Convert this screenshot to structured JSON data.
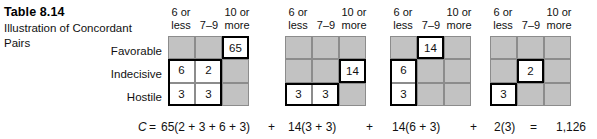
{
  "caption": {
    "table_number": "Table 8.14",
    "title": "Illustration of Concordant Pairs"
  },
  "row_labels": [
    "Favorable",
    "Indecisive",
    "Hostile"
  ],
  "column_headers": [
    {
      "line1": "6 or",
      "line2": "less"
    },
    {
      "line1": "",
      "line2": "7–9"
    },
    {
      "line1": "10 or",
      "line2": "more"
    }
  ],
  "grids": [
    {
      "name": "grid-1",
      "cells": [
        [
          {
            "value": "",
            "highlight": false,
            "boxed": false
          },
          {
            "value": "",
            "highlight": false,
            "boxed": false
          },
          {
            "value": "65",
            "highlight": true,
            "boxed": true
          }
        ],
        [
          {
            "value": "6",
            "highlight": true,
            "boxed": false
          },
          {
            "value": "2",
            "highlight": true,
            "boxed": false
          },
          {
            "value": "",
            "highlight": false,
            "boxed": false
          }
        ],
        [
          {
            "value": "3",
            "highlight": true,
            "boxed": false
          },
          {
            "value": "3",
            "highlight": true,
            "boxed": false
          },
          {
            "value": "",
            "highlight": false,
            "boxed": false
          }
        ]
      ],
      "outline": {
        "left": 0,
        "top": 23.33,
        "width": 54,
        "height": 46.66
      }
    },
    {
      "name": "grid-2",
      "cells": [
        [
          {
            "value": "",
            "highlight": false,
            "boxed": false
          },
          {
            "value": "",
            "highlight": false,
            "boxed": false
          },
          {
            "value": "",
            "highlight": false,
            "boxed": false
          }
        ],
        [
          {
            "value": "",
            "highlight": false,
            "boxed": false
          },
          {
            "value": "",
            "highlight": false,
            "boxed": false
          },
          {
            "value": "14",
            "highlight": true,
            "boxed": true
          }
        ],
        [
          {
            "value": "3",
            "highlight": true,
            "boxed": false
          },
          {
            "value": "3",
            "highlight": true,
            "boxed": false
          },
          {
            "value": "",
            "highlight": false,
            "boxed": false
          }
        ]
      ],
      "outline": {
        "left": 0,
        "top": 46.66,
        "width": 54,
        "height": 23.33
      }
    },
    {
      "name": "grid-3",
      "cells": [
        [
          {
            "value": "",
            "highlight": false,
            "boxed": false
          },
          {
            "value": "14",
            "highlight": true,
            "boxed": true
          },
          {
            "value": "",
            "highlight": false,
            "boxed": false
          }
        ],
        [
          {
            "value": "6",
            "highlight": true,
            "boxed": false
          },
          {
            "value": "",
            "highlight": false,
            "boxed": false
          },
          {
            "value": "",
            "highlight": false,
            "boxed": false
          }
        ],
        [
          {
            "value": "3",
            "highlight": true,
            "boxed": false
          },
          {
            "value": "",
            "highlight": false,
            "boxed": false
          },
          {
            "value": "",
            "highlight": false,
            "boxed": false
          }
        ]
      ],
      "outline": {
        "left": 0,
        "top": 23.33,
        "width": 27,
        "height": 46.66
      }
    },
    {
      "name": "grid-4",
      "cells": [
        [
          {
            "value": "",
            "highlight": false,
            "boxed": false
          },
          {
            "value": "",
            "highlight": false,
            "boxed": false
          },
          {
            "value": "",
            "highlight": false,
            "boxed": false
          }
        ],
        [
          {
            "value": "",
            "highlight": false,
            "boxed": false
          },
          {
            "value": "2",
            "highlight": true,
            "boxed": true
          },
          {
            "value": "",
            "highlight": false,
            "boxed": false
          }
        ],
        [
          {
            "value": "3",
            "highlight": true,
            "boxed": false
          },
          {
            "value": "",
            "highlight": false,
            "boxed": false
          },
          {
            "value": "",
            "highlight": false,
            "boxed": false
          }
        ]
      ],
      "outline": {
        "left": 0,
        "top": 46.66,
        "width": 27,
        "height": 23.33
      }
    }
  ],
  "formula": {
    "c_symbol": "C",
    "equals": "=",
    "term1": "65(2 + 3 + 6 + 3)",
    "plus1": "+",
    "term2": "14(3 + 3)",
    "plus2": "+",
    "term3": "14(6 + 3)",
    "plus3": "+",
    "term4": "2(3)",
    "equals2": "=",
    "result": "1,126"
  },
  "colors": {
    "cell_shade": "#c2c2c2",
    "cell_white": "#ffffff",
    "grid_line": "#8c8c8c",
    "heavy_line": "#000000",
    "text": "#111111"
  }
}
